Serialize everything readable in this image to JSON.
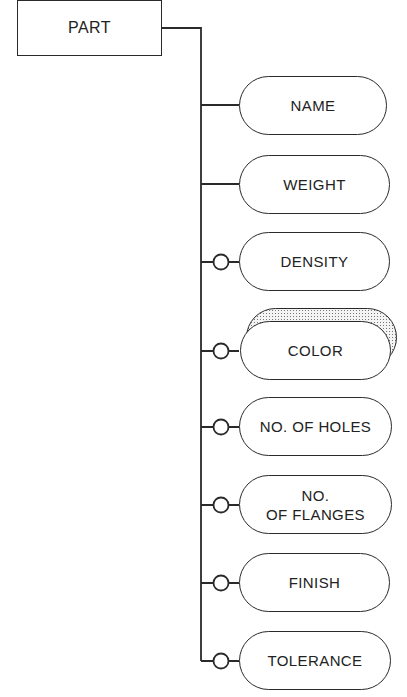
{
  "root": {
    "label": "PART"
  },
  "attributes": [
    {
      "label": "NAME",
      "optional": false,
      "top": 76
    },
    {
      "label": "WEIGHT",
      "optional": false,
      "top": 155
    },
    {
      "label": "DENSITY",
      "optional": true,
      "top": 232
    },
    {
      "label": "COLOR",
      "optional": true,
      "top": 321,
      "highlighted": true
    },
    {
      "label": "NO. OF HOLES",
      "optional": true,
      "top": 397
    },
    {
      "label_line1": "NO.",
      "label_line2": "OF FLANGES",
      "label": "NO. OF FLANGES",
      "optional": true,
      "top": 475
    },
    {
      "label": "FINISH",
      "optional": true,
      "top": 553
    },
    {
      "label": "TOLERANCE",
      "optional": true,
      "top": 631
    }
  ],
  "colors": {
    "line": "#2a2a2a",
    "background": "#ffffff"
  }
}
